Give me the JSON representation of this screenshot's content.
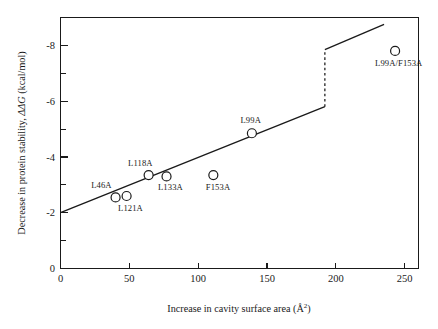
{
  "chart_data": {
    "type": "scatter",
    "title": "",
    "xlabel": "Increase in cavity surface area (Å²)",
    "xlabel_main": "Increase in cavity surface area (Å",
    "xlabel_sup": "2",
    "xlabel_tail": ")",
    "ylabel": "Decrease in protein stability, ΔΔG (kcal/mol)",
    "ylabel_part1": "Decrease in protein stability, ",
    "ylabel_italic": "ΔΔG",
    "ylabel_part2": " (kcal/mol)",
    "xlim": [
      0,
      260
    ],
    "ylim": [
      0,
      -9
    ],
    "xticks": [
      0,
      50,
      100,
      150,
      200,
      250
    ],
    "xtick_labels": [
      "0",
      "50",
      "100",
      "150",
      "200",
      "250"
    ],
    "yticks": [
      0,
      -2,
      -4,
      -6,
      -8
    ],
    "ytick_labels": [
      "0",
      "-2",
      "-4",
      "-6",
      "-8"
    ],
    "y_minor_ticks": [
      -1,
      -3,
      -5,
      -7,
      -9
    ],
    "grid": false,
    "legend": "none",
    "marker_style": "open-circle",
    "points": [
      {
        "label": "L46A",
        "x": 40,
        "y": -2.55,
        "label_dx": -16,
        "label_dy": -9
      },
      {
        "label": "L121A",
        "x": 48,
        "y": -2.6,
        "label_dx": 2,
        "label_dy": 15
      },
      {
        "label": "L118A",
        "x": 64,
        "y": -3.35,
        "label_dx": -10,
        "label_dy": -9
      },
      {
        "label": "L133A",
        "x": 77,
        "y": -3.3,
        "label_dx": 2,
        "label_dy": 14
      },
      {
        "label": "F153A",
        "x": 111,
        "y": -3.35,
        "label_dx": 3,
        "label_dy": 15
      },
      {
        "label": "L99A",
        "x": 139,
        "y": -4.85,
        "label_dx": -3,
        "label_dy": -10
      },
      {
        "label": "L99A/F153A",
        "x": 243,
        "y": -7.8,
        "label_dx": 1,
        "label_dy": 15
      }
    ],
    "fit_segments": [
      {
        "name": "lower-correlation-line",
        "x1": 0,
        "y1": -2.0,
        "x2": 192,
        "y2": -5.8,
        "style": "solid"
      },
      {
        "name": "offset-jump",
        "x1": 192,
        "y1": -5.8,
        "x2": 192,
        "y2": -7.85,
        "style": "dashed"
      },
      {
        "name": "upper-correlation-line",
        "x1": 192,
        "y1": -7.85,
        "x2": 235,
        "y2": -8.75,
        "style": "solid"
      }
    ],
    "annotations": []
  },
  "axes": {
    "frame": "full-box"
  }
}
